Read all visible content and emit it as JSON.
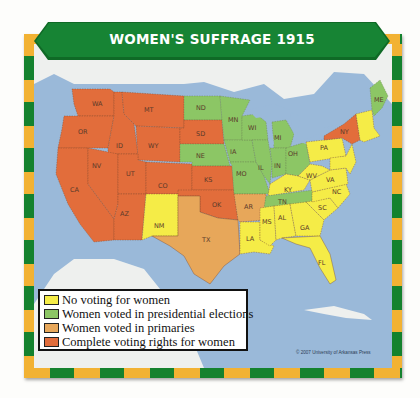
{
  "title": "WOMEN'S SUFFRAGE 1915",
  "colors": {
    "no_voting": "#f5ec47",
    "presidential": "#8cc665",
    "primaries": "#e7a75a",
    "complete": "#e26d3b",
    "water": "#9ab9d9",
    "land_other": "#eef0ee",
    "banner": "#178434",
    "border_yellow": "#f2b233",
    "border_green": "#14822e"
  },
  "legend": {
    "items": [
      {
        "label": "No voting for women",
        "color": "#f5ec47"
      },
      {
        "label": "Women voted in presidential elections",
        "color": "#8cc665"
      },
      {
        "label": "Women voted in primaries",
        "color": "#e7a75a"
      },
      {
        "label": "Complete voting rights for women",
        "color": "#e26d3b"
      }
    ]
  },
  "states": {
    "complete": [
      "WA",
      "OR",
      "CA",
      "ID",
      "NV",
      "MT",
      "WY",
      "UT",
      "AZ",
      "CO",
      "SD",
      "KS",
      "OK",
      "NY"
    ],
    "presidential": [
      "ND",
      "NE",
      "MN",
      "WI",
      "IA",
      "MO",
      "IL",
      "MI",
      "IN",
      "OH",
      "TN",
      "ME"
    ],
    "primaries": [
      "TX",
      "AR"
    ],
    "no_voting": [
      "NM",
      "KY",
      "WV",
      "VA",
      "PA",
      "NC",
      "SC",
      "GA",
      "AL",
      "MS",
      "LA",
      "FL",
      "VT",
      "NH",
      "MA",
      "RI",
      "CT",
      "NJ",
      "DE",
      "MD"
    ]
  },
  "labels": {
    "WA": "WA",
    "OR": "OR",
    "CA": "CA",
    "ID": "ID",
    "NV": "NV",
    "MT": "MT",
    "WY": "WY",
    "UT": "UT",
    "AZ": "AZ",
    "CO": "CO",
    "NM": "NM",
    "ND": "ND",
    "SD": "SD",
    "NE": "NE",
    "KS": "KS",
    "OK": "OK",
    "TX": "TX",
    "MN": "MN",
    "IA": "IA",
    "MO": "MO",
    "AR": "AR",
    "LA": "LA",
    "WI": "WI",
    "IL": "IL",
    "MI": "MI",
    "IN": "IN",
    "OH": "OH",
    "KY": "KY",
    "TN": "TN",
    "MS": "MS",
    "AL": "AL",
    "GA": "GA",
    "FL": "FL",
    "SC": "SC",
    "NC": "NC",
    "VA": "VA",
    "WV": "WV",
    "PA": "PA",
    "NY": "NY",
    "ME": "ME",
    "VT": "VT",
    "NH": "NH",
    "MA": "MA"
  },
  "copyright": "© 2007 University of Arkansas Press"
}
